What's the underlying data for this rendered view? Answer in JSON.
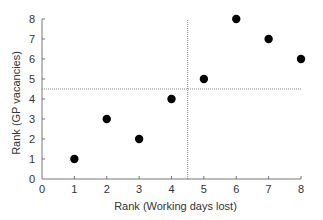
{
  "chart_data": {
    "type": "scatter",
    "title": "",
    "xlabel": "Rank (Working days lost)",
    "ylabel": "Rank (GP vacancies)",
    "xlim": [
      0,
      8
    ],
    "ylim": [
      0,
      8
    ],
    "xticks": [
      0,
      1,
      2,
      3,
      4,
      5,
      6,
      7,
      8
    ],
    "yticks": [
      0,
      1,
      2,
      3,
      4,
      5,
      6,
      7,
      8
    ],
    "grid": false,
    "legend": null,
    "points": [
      {
        "x": 1,
        "y": 1
      },
      {
        "x": 2,
        "y": 3
      },
      {
        "x": 3,
        "y": 2
      },
      {
        "x": 4,
        "y": 4
      },
      {
        "x": 5,
        "y": 5
      },
      {
        "x": 6,
        "y": 8
      },
      {
        "x": 7,
        "y": 7
      },
      {
        "x": 8,
        "y": 6
      }
    ],
    "reference_lines": [
      {
        "orientation": "vertical",
        "value": 4.5,
        "style": "dotted"
      },
      {
        "orientation": "horizontal",
        "value": 4.5,
        "style": "dotted"
      }
    ],
    "colors": {
      "marker": "#000000",
      "axis": "#777777",
      "reference": "#8a8a8a",
      "text": "#333333"
    }
  }
}
